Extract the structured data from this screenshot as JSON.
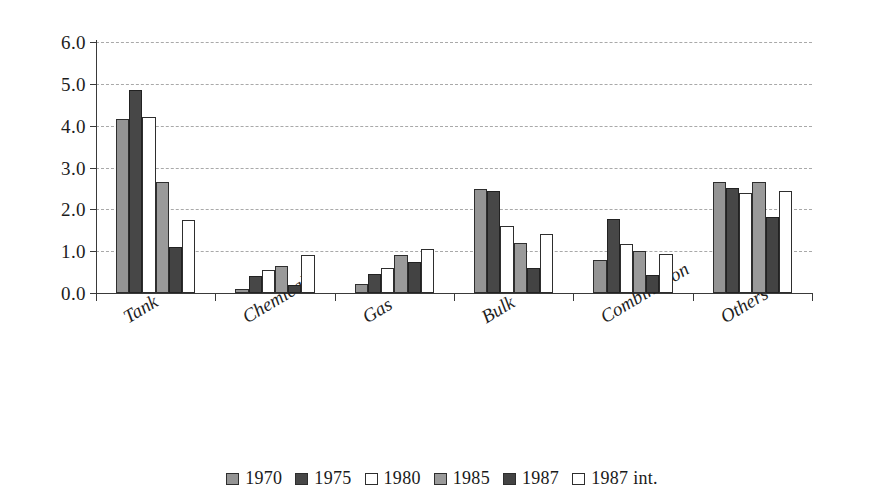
{
  "chart_data": {
    "type": "bar",
    "title": "",
    "subtitle": "",
    "xlabel": "",
    "ylabel": "",
    "categories": [
      "Tank",
      "Chemical",
      "Gas",
      "Bulk",
      "Combination",
      "Others"
    ],
    "series": [
      {
        "name": "1970",
        "color": "#949494",
        "values": [
          4.15,
          0.1,
          0.22,
          2.48,
          0.8,
          2.65
        ]
      },
      {
        "name": "1975",
        "color": "#474747",
        "values": [
          4.85,
          0.4,
          0.45,
          2.45,
          1.78,
          2.52
        ]
      },
      {
        "name": "1980",
        "color": "#ffffff",
        "values": [
          4.2,
          0.55,
          0.6,
          1.6,
          1.18,
          2.4
        ]
      },
      {
        "name": "1985",
        "color": "#9a9a9a",
        "values": [
          2.65,
          0.65,
          0.9,
          1.2,
          1.0,
          2.65
        ]
      },
      {
        "name": "1987",
        "color": "#434343",
        "values": [
          1.1,
          0.2,
          0.75,
          0.6,
          0.42,
          1.82
        ]
      },
      {
        "name": "1987 int.",
        "color": "#ffffff",
        "values": [
          1.75,
          0.9,
          1.05,
          1.4,
          0.93,
          2.45
        ]
      }
    ],
    "ylim": [
      0.0,
      6.0
    ],
    "ytick_labels": [
      "0.0",
      "1.0",
      "2.0",
      "3.0",
      "4.0",
      "5.0",
      "6.0"
    ],
    "ytick_values": [
      0.0,
      1.0,
      2.0,
      3.0,
      4.0,
      5.0,
      6.0
    ],
    "grid": "horizontal-dashed",
    "legend_position": "bottom"
  },
  "legend": {
    "items": [
      {
        "label": "1970"
      },
      {
        "label": "1975"
      },
      {
        "label": "1980"
      },
      {
        "label": "1985"
      },
      {
        "label": "1987"
      },
      {
        "label": "1987  int."
      }
    ]
  }
}
